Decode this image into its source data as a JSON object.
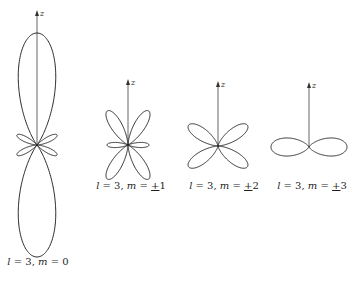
{
  "diagram": {
    "axis_label": "z",
    "stroke_color": "#2a2a2a",
    "panels": [
      {
        "id": "m0",
        "l": 3,
        "m_text": "0",
        "pm": "",
        "label_l": "l",
        "label_eq1": " = 3, ",
        "label_m": "m",
        "label_eq2": " = ",
        "label_val": "0",
        "center": [
          37,
          145
        ],
        "scale": 112,
        "axis_top": 10,
        "axis_bottom": 145,
        "label_pos": [
          38,
          262
        ],
        "function": "(5cos^3θ - 3cosθ)^2 / 4"
      },
      {
        "id": "m1",
        "l": 3,
        "label_l": "l",
        "label_eq1": " = 3, ",
        "label_m": "m",
        "label_eq2": " = ",
        "label_pm": "+",
        "label_val": "1",
        "center": [
          128,
          145
        ],
        "scale": 40,
        "axis_top": 79,
        "axis_bottom": 145,
        "label_pos": [
          131,
          186
        ],
        "function": "(sinθ(5cos^2θ - 1))^2 normalized"
      },
      {
        "id": "m2",
        "l": 3,
        "label_l": "l",
        "label_eq1": " = 3, ",
        "label_m": "m",
        "label_eq2": " = ",
        "label_pm": "+",
        "label_val": "2",
        "center": [
          218,
          146
        ],
        "scale": 36,
        "axis_top": 81,
        "axis_bottom": 146,
        "label_pos": [
          224,
          186
        ],
        "function": "(sin^2θ cosθ)^2 normalized"
      },
      {
        "id": "m3",
        "l": 3,
        "label_l": "l",
        "label_eq1": " = 3, ",
        "label_m": "m",
        "label_eq2": " = ",
        "label_pm": "+",
        "label_val": "3",
        "center": [
          309,
          147
        ],
        "scale": 38,
        "axis_top": 82,
        "axis_bottom": 147,
        "label_pos": [
          312,
          186
        ],
        "function": "sin^6θ"
      }
    ]
  }
}
